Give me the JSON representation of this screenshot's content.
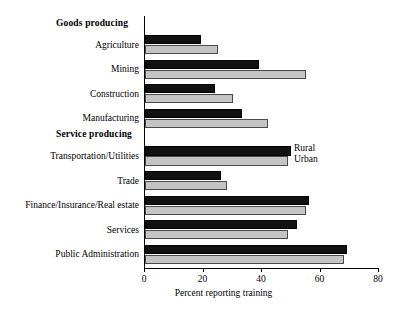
{
  "chart_data": {
    "type": "bar",
    "orientation": "horizontal",
    "title": "",
    "xlabel": "Percent reporting training",
    "ylabel": "",
    "xlim": [
      0,
      80
    ],
    "xticks": [
      0,
      20,
      40,
      60,
      80
    ],
    "grid": false,
    "legend_position": "inside-right-upper",
    "groups": [
      {
        "header": "Goods producing",
        "categories": [
          "Agriculture",
          "Mining",
          "Construction",
          "Manufacturing"
        ]
      },
      {
        "header": "Service producing",
        "categories": [
          "Transportation/Utilities",
          "Trade",
          "Finance/Insurance/Real estate",
          "Services",
          "Public Administration"
        ]
      }
    ],
    "categories": [
      "Agriculture",
      "Mining",
      "Construction",
      "Manufacturing",
      "Transportation/Utilities",
      "Trade",
      "Finance/Insurance/Real estate",
      "Services",
      "Public Administration"
    ],
    "series": [
      {
        "name": "Rural",
        "color": "#111111",
        "values": [
          19,
          39,
          24,
          33,
          50,
          26,
          56,
          52,
          69
        ]
      },
      {
        "name": "Urban",
        "color": "#c4c4c4",
        "values": [
          25,
          55,
          30,
          42,
          49,
          28,
          55,
          49,
          68
        ]
      }
    ]
  },
  "axis": {
    "tick_labels": [
      "0",
      "20",
      "40",
      "60",
      "80"
    ],
    "x_title": "Percent reporting training"
  },
  "legend": {
    "rural_label": "Rural",
    "urban_label": "Urban"
  },
  "headers": {
    "goods": "Goods producing",
    "service": "Service producing"
  },
  "labels": {
    "agriculture": "Agriculture",
    "mining": "Mining",
    "construction": "Construction",
    "manufacturing": "Manufacturing",
    "transportation": "Transportation/Utilities",
    "trade": "Trade",
    "finance": "Finance/Insurance/Real estate",
    "services": "Services",
    "public_administration": "Public Administration"
  }
}
